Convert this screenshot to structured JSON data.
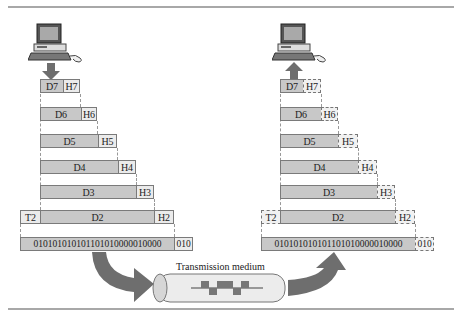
{
  "sender": {
    "layers": [
      {
        "data": "D7",
        "header": "H7"
      },
      {
        "data": "D6",
        "header": "H6"
      },
      {
        "data": "D5",
        "header": "H5"
      },
      {
        "data": "D4",
        "header": "H4"
      },
      {
        "data": "D3",
        "header": "H3"
      },
      {
        "data": "D2",
        "header": "H2",
        "trailer": "T2"
      }
    ],
    "bits": "010101010101101010000010000",
    "bits_tail": "010"
  },
  "receiver": {
    "layers": [
      {
        "data": "D7",
        "header": "H7"
      },
      {
        "data": "D6",
        "header": "H6"
      },
      {
        "data": "D5",
        "header": "H5"
      },
      {
        "data": "D4",
        "header": "H4"
      },
      {
        "data": "D3",
        "header": "H3"
      },
      {
        "data": "D2",
        "header": "H2",
        "trailer": "T2"
      }
    ],
    "bits": "010101010101101010000010000",
    "bits_tail": "010"
  },
  "medium": {
    "label": "Transmission medium"
  },
  "colors": {
    "data_fill": "#c8c8c8",
    "header_fill": "#ebebeb",
    "arrow": "#6e6e6e",
    "rule": "#a8a8a8"
  }
}
